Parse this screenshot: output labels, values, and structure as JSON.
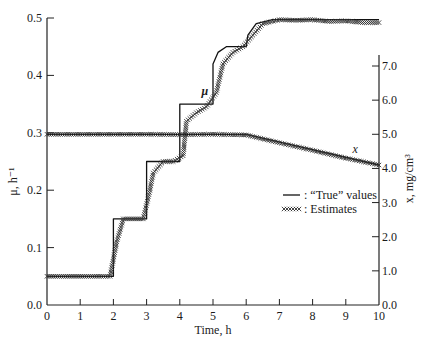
{
  "chart_data": {
    "type": "line",
    "title": "",
    "xlabel": "Time, h",
    "ylabel_left": "μ, h⁻¹",
    "ylabel_right": "x,  mg/cm³",
    "xlim": [
      0,
      10
    ],
    "ylim_left": [
      0.0,
      0.5
    ],
    "ylim_right": [
      0.0,
      7.0
    ],
    "x_ticks": [
      "0",
      "1",
      "2",
      "3",
      "4",
      "5",
      "6",
      "7",
      "8",
      "9",
      "10"
    ],
    "y_ticks_left": [
      "0.0",
      "0.1",
      "0.2",
      "0.3",
      "0.4",
      "0.5"
    ],
    "y_ticks_right": [
      "0.0",
      "1.0",
      "2.0",
      "3.0",
      "4.0",
      "5.0",
      "6.0",
      "7.0"
    ],
    "grid": false,
    "legend_position": "right-center",
    "legend": [
      {
        "marker": "line",
        "label": ": “True” values"
      },
      {
        "marker": "xxxxx",
        "label": ": Estimates"
      }
    ],
    "annotations": [
      {
        "text": "μ",
        "near": "t≈4.7, μ≈0.37"
      },
      {
        "text": "x",
        "near": "t≈9.2, x≈4.4"
      }
    ],
    "series": [
      {
        "name": "mu_true",
        "axis": "left",
        "style": "solid",
        "points": [
          [
            0,
            0.05
          ],
          [
            2,
            0.05
          ],
          [
            2,
            0.15
          ],
          [
            3,
            0.15
          ],
          [
            3,
            0.25
          ],
          [
            4,
            0.25
          ],
          [
            4,
            0.35
          ],
          [
            5,
            0.35
          ],
          [
            5,
            0.42
          ],
          [
            5.15,
            0.44
          ],
          [
            5.4,
            0.45
          ],
          [
            6,
            0.45
          ],
          [
            6.05,
            0.47
          ],
          [
            6.3,
            0.49
          ],
          [
            6.8,
            0.497
          ],
          [
            10,
            0.497
          ]
        ]
      },
      {
        "name": "mu_estimates",
        "axis": "left",
        "style": "x-markers",
        "points": [
          [
            0,
            0.05
          ],
          [
            0.5,
            0.05
          ],
          [
            1,
            0.05
          ],
          [
            1.5,
            0.05
          ],
          [
            1.9,
            0.05
          ],
          [
            2.1,
            0.11
          ],
          [
            2.3,
            0.15
          ],
          [
            2.6,
            0.15
          ],
          [
            2.9,
            0.15
          ],
          [
            3.1,
            0.2
          ],
          [
            3.2,
            0.23
          ],
          [
            3.5,
            0.25
          ],
          [
            3.8,
            0.25
          ],
          [
            4.1,
            0.26
          ],
          [
            4.2,
            0.32
          ],
          [
            4.5,
            0.335
          ],
          [
            4.8,
            0.345
          ],
          [
            5.1,
            0.37
          ],
          [
            5.3,
            0.42
          ],
          [
            5.6,
            0.44
          ],
          [
            5.9,
            0.45
          ],
          [
            6.2,
            0.47
          ],
          [
            6.5,
            0.49
          ],
          [
            7,
            0.497
          ],
          [
            7.5,
            0.496
          ],
          [
            8,
            0.497
          ],
          [
            8.5,
            0.494
          ],
          [
            9,
            0.495
          ],
          [
            9.5,
            0.492
          ],
          [
            10,
            0.492
          ]
        ]
      },
      {
        "name": "x_true",
        "axis": "right",
        "style": "solid",
        "points": [
          [
            0,
            5.0
          ],
          [
            6,
            5.0
          ],
          [
            10,
            4.1
          ]
        ]
      },
      {
        "name": "x_estimates",
        "axis": "right",
        "style": "x-markers",
        "points": [
          [
            0,
            5.0
          ],
          [
            1,
            5.0
          ],
          [
            2,
            5.0
          ],
          [
            3,
            5.0
          ],
          [
            4,
            4.99
          ],
          [
            5,
            5.0
          ],
          [
            6,
            4.98
          ],
          [
            7,
            4.75
          ],
          [
            8,
            4.53
          ],
          [
            9,
            4.3
          ],
          [
            10,
            4.1
          ]
        ]
      }
    ]
  }
}
